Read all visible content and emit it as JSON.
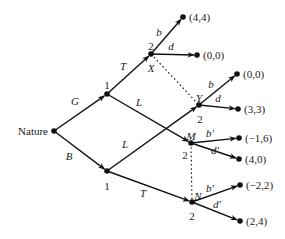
{
  "diagram": {
    "type": "extensive-form game tree",
    "root": {
      "id": "nature",
      "label": "Nature",
      "x": 54,
      "y": 131
    },
    "nodes": [
      {
        "id": "g1",
        "player": "1",
        "x": 107,
        "y": 94,
        "player_label_pos": [
          107,
          85
        ]
      },
      {
        "id": "b1",
        "player": "1",
        "x": 107,
        "y": 171,
        "player_label_pos": [
          107,
          186
        ]
      },
      {
        "id": "X",
        "name": "X",
        "player": "2",
        "x": 151,
        "y": 54,
        "player_label_pos": [
          151,
          46
        ],
        "name_pos": [
          151,
          68
        ]
      },
      {
        "id": "Y",
        "name": "Y",
        "player": "2",
        "x": 199,
        "y": 105,
        "player_label_pos": [
          200,
          119
        ],
        "name_pos": [
          199,
          98
        ]
      },
      {
        "id": "M",
        "name": "M",
        "player": "2",
        "x": 191,
        "y": 143,
        "player_label_pos": [
          185,
          155
        ],
        "name_pos": [
          191,
          136
        ]
      },
      {
        "id": "N",
        "name": "N",
        "player": "2",
        "x": 192,
        "y": 202,
        "player_label_pos": [
          192,
          216
        ],
        "name_pos": [
          198,
          196
        ]
      }
    ],
    "terminals": [
      {
        "id": "t1",
        "x": 183,
        "y": 17,
        "payoff": "(4,4)"
      },
      {
        "id": "t2",
        "x": 197,
        "y": 55,
        "payoff": "(0,0)"
      },
      {
        "id": "t3",
        "x": 237,
        "y": 74,
        "payoff": "(0,0)"
      },
      {
        "id": "t4",
        "x": 238,
        "y": 109,
        "payoff": "(3,3)"
      },
      {
        "id": "t5",
        "x": 239,
        "y": 138,
        "payoff": "(−1,6)"
      },
      {
        "id": "t6",
        "x": 239,
        "y": 159,
        "payoff": "(4,0)"
      },
      {
        "id": "t7",
        "x": 240,
        "y": 185,
        "payoff": "(−2,2)"
      },
      {
        "id": "t8",
        "x": 240,
        "y": 221,
        "payoff": "(2,4)"
      }
    ],
    "edges": [
      {
        "from": "nature",
        "to": "g1",
        "label": "G",
        "label_pos": [
          75,
          105
        ]
      },
      {
        "from": "nature",
        "to": "b1",
        "label": "B",
        "label_pos": [
          69,
          160
        ]
      },
      {
        "from": "g1",
        "to": "X",
        "label": "T",
        "label_pos": [
          123,
          70
        ]
      },
      {
        "from": "g1",
        "to": "M",
        "label": "L",
        "label_pos": [
          139,
          106
        ]
      },
      {
        "from": "b1",
        "to": "Y",
        "label": "L",
        "label_pos": [
          125,
          148
        ]
      },
      {
        "from": "b1",
        "to": "N",
        "label": "T",
        "label_pos": [
          143,
          197
        ]
      },
      {
        "from": "X",
        "to": "t1",
        "label": "b",
        "label_pos": [
          159,
          36
        ]
      },
      {
        "from": "X",
        "to": "t2",
        "label": "d",
        "label_pos": [
          171,
          50
        ]
      },
      {
        "from": "Y",
        "to": "t3",
        "label": "b",
        "label_pos": [
          211,
          88
        ]
      },
      {
        "from": "Y",
        "to": "t4",
        "label": "d",
        "label_pos": [
          218,
          102
        ]
      },
      {
        "from": "M",
        "to": "t5",
        "label": "b′",
        "label_pos": [
          210,
          137
        ]
      },
      {
        "from": "M",
        "to": "t6",
        "label": "d′",
        "label_pos": [
          215,
          154
        ]
      },
      {
        "from": "N",
        "to": "t7",
        "label": "b′",
        "label_pos": [
          210,
          192
        ]
      },
      {
        "from": "N",
        "to": "t8",
        "label": "d′",
        "label_pos": [
          217,
          208
        ]
      }
    ],
    "information_sets": [
      {
        "nodes": [
          "X",
          "Y"
        ],
        "style": "dotted"
      },
      {
        "nodes": [
          "M",
          "N"
        ],
        "style": "dotted"
      }
    ]
  }
}
